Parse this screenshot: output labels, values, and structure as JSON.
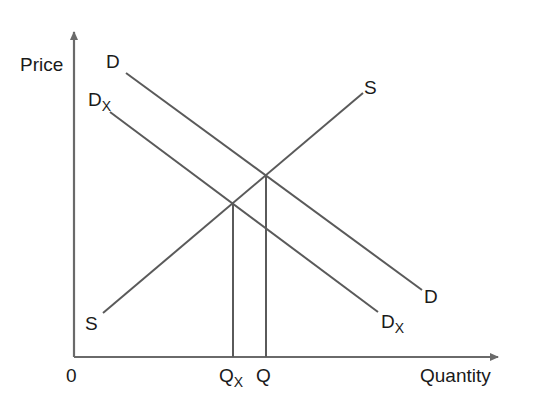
{
  "diagram": {
    "type": "supply-demand",
    "axes": {
      "y_label": "Price",
      "x_label": "Quantity",
      "origin_label": "0"
    },
    "curves": {
      "supply": {
        "label_start": "S",
        "label_end": "S"
      },
      "demand": {
        "label_start": "D",
        "label_end": "D"
      },
      "demand_shifted": {
        "label_start_main": "D",
        "label_start_sub": "X",
        "label_end_main": "D",
        "label_end_sub": "X"
      }
    },
    "quantity_markers": {
      "qx_main": "Q",
      "qx_sub": "X",
      "q": "Q"
    },
    "colors": {
      "line": "#5a5a5a",
      "axis": "#6a6a6a",
      "text": "#1a1a1a"
    }
  }
}
